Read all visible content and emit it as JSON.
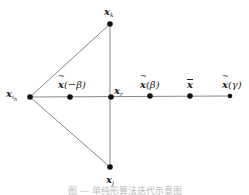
{
  "diagram": {
    "type": "geometric-node-diagram",
    "line_color": "#888888",
    "node_color": "#111111",
    "nodes": [
      {
        "id": "x_ih",
        "label": "x",
        "sub": "i_h",
        "decoration": "none",
        "x": 30,
        "y": 97,
        "label_x": 6,
        "label_y": 89
      },
      {
        "id": "x_k",
        "label": "x",
        "sub": "k",
        "decoration": "none",
        "x": 110,
        "y": 24,
        "label_x": 104,
        "label_y": 7
      },
      {
        "id": "x_j",
        "label": "x",
        "sub": "j",
        "decoration": "none",
        "x": 110,
        "y": 167,
        "label_x": 106,
        "label_y": 175
      },
      {
        "id": "x_r",
        "label": "x",
        "sub": "r",
        "decoration": "none",
        "x": 111,
        "y": 97,
        "label_x": 114,
        "label_y": 86
      },
      {
        "id": "xt_neg_beta",
        "label": "x",
        "arg": "(−β)",
        "decoration": "tilde",
        "x": 70,
        "y": 97,
        "label_x": 58,
        "label_y": 80
      },
      {
        "id": "xt_beta",
        "label": "x",
        "arg": "(β)",
        "decoration": "tilde",
        "x": 150,
        "y": 96,
        "label_x": 140,
        "label_y": 80
      },
      {
        "id": "x_bar",
        "label": "x",
        "arg": "",
        "decoration": "bar",
        "x": 190,
        "y": 96,
        "label_x": 187,
        "label_y": 80
      },
      {
        "id": "xt_gamma",
        "label": "x",
        "arg": "(γ)",
        "decoration": "tilde",
        "x": 230,
        "y": 96,
        "label_x": 222,
        "label_y": 80
      }
    ],
    "edges": [
      [
        "x_ih",
        "x_k"
      ],
      [
        "x_ih",
        "x_j"
      ],
      [
        "x_k",
        "x_j"
      ],
      [
        "x_ih",
        "xt_gamma"
      ]
    ]
  },
  "caption": "图 — 单纯形算法迭代示意图"
}
